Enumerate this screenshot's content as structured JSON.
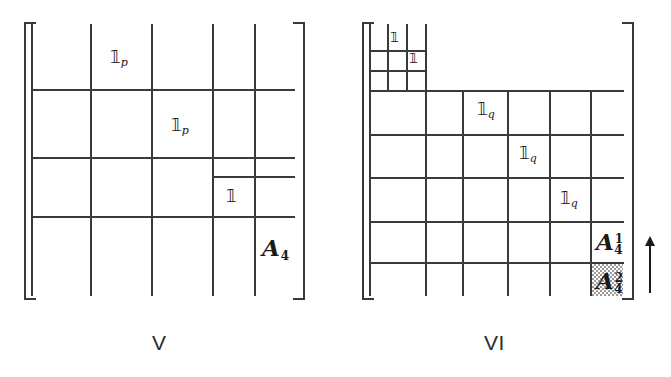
{
  "figure": {
    "caption_left": "V",
    "caption_right": "VI",
    "ink_color": "#3a3a3a",
    "shade_color": "#9a9a9a",
    "background": "#ffffff"
  },
  "matrix_v": {
    "caption": "V",
    "labels": {
      "one_p_upper": {
        "symbol": "ᵽ9",
        "subscript": "p"
      },
      "one_p_lower": {
        "symbol": "ᵽ9",
        "subscript": "p"
      },
      "one_plain": {
        "symbol": "ᵽ9",
        "subscript": ""
      },
      "a4": {
        "base": "A",
        "superscript": "",
        "subscript": "4"
      }
    },
    "label_texts": {
      "one_p_upper_base": "𝟙",
      "one_p_upper_sub": "p",
      "one_p_lower_base": "𝟙",
      "one_p_lower_sub": "p",
      "one_plain_base": "𝟙",
      "a4_base": "A",
      "a4_sub": "4"
    }
  },
  "matrix_vi": {
    "caption": "VI",
    "label_texts": {
      "one_nested_a": "𝟙",
      "one_nested_b": "𝟙",
      "one_q_1_base": "𝟙",
      "one_q_1_sub": "q",
      "one_q_2_base": "𝟙",
      "one_q_2_sub": "q",
      "one_q_3_base": "𝟙",
      "one_q_3_sub": "q",
      "a41_base": "A",
      "a41_sup": "1",
      "a41_sub": "4",
      "a42_base": "A",
      "a42_sup": "2",
      "a42_sub": "4"
    },
    "annotation": {
      "arrow_direction": "up",
      "shaded_cell": "A_4^2"
    }
  }
}
